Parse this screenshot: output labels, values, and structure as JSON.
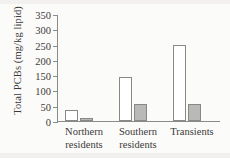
{
  "chart_data": {
    "type": "bar",
    "title": "",
    "xlabel": "",
    "ylabel": "Total PCBs (mg/kg lipid)",
    "ylim": [
      0,
      350
    ],
    "yticks": [
      0,
      50,
      100,
      150,
      200,
      250,
      300,
      350
    ],
    "ytick_labels": [
      "0",
      "50",
      "100",
      "150",
      "200",
      "250",
      "300",
      "350"
    ],
    "grid": false,
    "legend": "none",
    "categories": [
      "Northern residents",
      "Southern residents",
      "Transients"
    ],
    "category_lines": [
      [
        "Northern",
        "residents"
      ],
      [
        "Southern",
        "residents"
      ],
      [
        "Transients",
        ""
      ]
    ],
    "series": [
      {
        "name": "white-bar",
        "fill": "#ffffff",
        "edge": "#8a8886",
        "values": [
          35,
          145,
          250
        ]
      },
      {
        "name": "gray-bar",
        "fill": "#b9b9b7",
        "edge": "#8a8886",
        "values": [
          10,
          55,
          57
        ]
      }
    ],
    "axis_color": "#8d8b89",
    "background": "#fbfbfa",
    "text_color": "#3c3a39"
  }
}
